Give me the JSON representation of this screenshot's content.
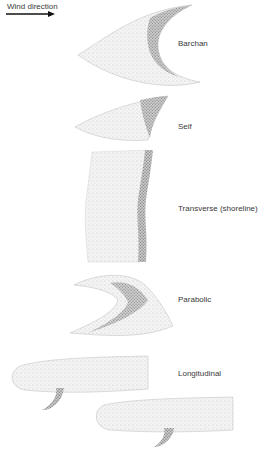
{
  "diagram": {
    "wind_label": "Wind direction",
    "wind_arrow_icon": "arrow-right",
    "dunes": [
      {
        "label": "Barchan"
      },
      {
        "label": "Seif"
      },
      {
        "label": "Transverse (shoreline)"
      },
      {
        "label": "Parabolic"
      },
      {
        "label": "Longitudinal"
      }
    ],
    "colors": {
      "light_sand": "#e6e6e6",
      "dark_sand": "#8a8a8a",
      "outline": "#b5b5b5"
    }
  }
}
